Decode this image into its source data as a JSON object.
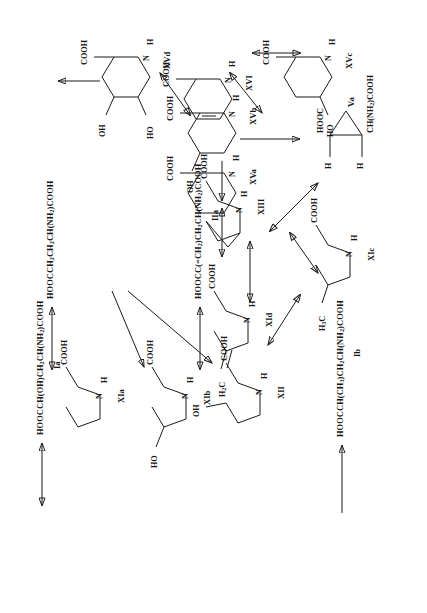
{
  "diagram": {
    "orientation": "rotated-90-ccw",
    "background_color": "#ffffff",
    "line_color": "#1a1a1a"
  },
  "compounds": {
    "Ia": {
      "label": "Ia",
      "formula_html": "HOOCCH(OH)CH<sub>2</sub>CH(NH<sub>2</sub>)COOH",
      "kind": "linear-formula"
    },
    "IIa": {
      "label": "IIa",
      "formula_html": "HOOCC(=CH<sub>2</sub>)CH<sub>2</sub>CH(NH<sub>2</sub>)COOH",
      "kind": "linear-formula"
    },
    "Ib": {
      "label": "Ib",
      "formula_html": "HOOCCH(CH<sub>3</sub>)CH<sub>2</sub>CH(NH<sub>2</sub>)COOH",
      "kind": "linear-formula"
    },
    "XIa_f": {
      "label": "",
      "formula_html": "HOOCCH<sub>2</sub>CH<sub>2</sub>CH(NH<sub>2</sub>)COOH",
      "kind": "linear-formula"
    },
    "XIa": {
      "label": "XIa",
      "kind": "pyrrolidine",
      "substituents": [
        "COOH"
      ]
    },
    "XIb": {
      "label": "XIb",
      "kind": "pyrrolidine",
      "substituents": [
        "COOH",
        "HO"
      ]
    },
    "XII": {
      "label": "XII",
      "kind": "pyrrolidine",
      "substituents": [
        "COOH",
        "OH"
      ]
    },
    "XId": {
      "label": "XId",
      "kind": "pyrrolidine",
      "substituents": [
        "COOH",
        "H2C="
      ]
    },
    "XIc": {
      "label": "XIc",
      "kind": "pyrrolidine",
      "substituents": [
        "COOH",
        "H3C"
      ]
    },
    "XIII": {
      "label": "XIII",
      "kind": "azabicyclo",
      "substituents": [
        "COOH"
      ]
    },
    "Va": {
      "label": "Va",
      "kind": "cyclopropane",
      "substituents": [
        "HOOC",
        "CH(NH2)COOH",
        "H",
        "H"
      ]
    },
    "XVa": {
      "label": "XVa",
      "kind": "piperidine",
      "substituents": [
        "COOH"
      ]
    },
    "XVb": {
      "label": "XVb",
      "kind": "piperidine",
      "substituents": [
        "COOH",
        "OH"
      ]
    },
    "XVc": {
      "label": "XVc",
      "kind": "piperidine",
      "substituents": [
        "COOH",
        "HO"
      ]
    },
    "XVd": {
      "label": "XVd",
      "kind": "piperidine",
      "substituents": [
        "COOH",
        "OH",
        "HO"
      ]
    },
    "XVI": {
      "label": "XVI",
      "kind": "tetrahydropyridine",
      "substituents": [
        "COOH"
      ]
    }
  },
  "atoms": {
    "COOH": "COOH",
    "OH": "OH",
    "HO": "HO",
    "N": "N",
    "H": "H",
    "NH": "H",
    "H2C": "H<sub>2</sub>C",
    "H3C": "H<sub>3</sub>C",
    "HOOC": "HOOC",
    "CHNH2COOH": "CH(NH<sub>2</sub>)COOH"
  },
  "edges": [
    {
      "from": "XIa_f",
      "to": "Ia",
      "type": "double-headed"
    },
    {
      "from": "XIa",
      "to": "XIa_f",
      "type": "double-headed"
    },
    {
      "from": "XIa",
      "to": "XIb",
      "type": "single"
    },
    {
      "from": "XIa",
      "to": "XII",
      "type": "single"
    },
    {
      "from": "XId",
      "to": "IIa",
      "type": "double-headed"
    },
    {
      "from": "XIc",
      "to": "Ib",
      "type": "single"
    },
    {
      "from": "XId",
      "to": "XIII",
      "type": "double-headed"
    },
    {
      "from": "XIc",
      "to": "XId",
      "type": "double-headed"
    },
    {
      "from": "XIII",
      "to": "XIc",
      "type": "double-headed"
    },
    {
      "from": "XIII",
      "to": "Va",
      "type": "double-headed"
    },
    {
      "from": "XVa",
      "to": "XIII",
      "type": "double-headed"
    },
    {
      "from": "XVa",
      "to": "XVb",
      "type": "single"
    },
    {
      "from": "XVa",
      "to": "XVc",
      "type": "single"
    },
    {
      "from": "XVb",
      "to": "XVI",
      "type": "double-headed"
    },
    {
      "from": "XVI",
      "to": "XVc",
      "type": "double-headed"
    },
    {
      "from": "XVb",
      "to": "XVd",
      "type": "single"
    },
    {
      "from": "XVc",
      "to": "XVd",
      "type": "double-headed"
    }
  ]
}
